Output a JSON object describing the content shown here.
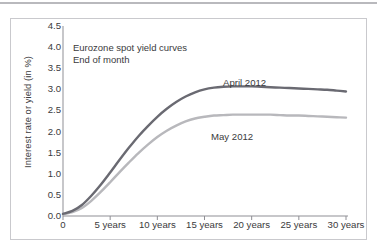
{
  "figure": {
    "title_lines": "Eurozone spot yield curves\nEnd of month",
    "y_axis_title": "Interest rate or yield (in %)"
  },
  "colors": {
    "april_series": "#6a6a72",
    "may_series": "#b8b8bc",
    "axis": "#8f8f95",
    "frame": "#c9c9cd",
    "text": "#3a3a3c"
  },
  "chart_data": {
    "type": "line",
    "title": "Eurozone spot yield curves",
    "subtitle": "End of month",
    "xlabel": "",
    "ylabel": "Interest rate or yield (in %)",
    "xlim": [
      0,
      30
    ],
    "ylim": [
      0.0,
      4.5
    ],
    "grid": false,
    "legend_position": "inline-annotation",
    "x_tick_labels": [
      "0",
      "5 years",
      "10 years",
      "15 years",
      "20 years",
      "25 years",
      "30 years"
    ],
    "x_ticks": [
      0,
      5,
      10,
      15,
      20,
      25,
      30
    ],
    "y_ticks": [
      0.0,
      0.5,
      1.0,
      1.5,
      2.0,
      2.5,
      3.0,
      3.5,
      4.0,
      4.5
    ],
    "y_tick_labels": [
      "0.0",
      "0.5",
      "1.0",
      "1.5",
      "2.0",
      "2.5",
      "3.0",
      "3.5",
      "4.0",
      "4.5"
    ],
    "x": [
      0,
      1,
      2,
      3,
      4,
      5,
      6,
      7,
      8,
      9,
      10,
      11,
      12,
      13,
      14,
      15,
      16,
      17,
      18,
      19,
      20,
      21,
      22,
      23,
      24,
      25,
      26,
      27,
      28,
      29,
      30
    ],
    "series": [
      {
        "name": "April 2012",
        "color": "#6a6a72",
        "values": [
          0.05,
          0.12,
          0.26,
          0.48,
          0.74,
          1.03,
          1.33,
          1.62,
          1.89,
          2.13,
          2.35,
          2.54,
          2.7,
          2.83,
          2.93,
          3.0,
          3.04,
          3.06,
          3.07,
          3.07,
          3.07,
          3.06,
          3.05,
          3.04,
          3.03,
          3.02,
          3.01,
          3.0,
          2.99,
          2.97,
          2.95
        ]
      },
      {
        "name": "May 2012",
        "color": "#b8b8bc",
        "values": [
          0.04,
          0.09,
          0.19,
          0.36,
          0.57,
          0.8,
          1.04,
          1.27,
          1.49,
          1.69,
          1.87,
          2.02,
          2.14,
          2.24,
          2.31,
          2.35,
          2.38,
          2.39,
          2.4,
          2.4,
          2.4,
          2.4,
          2.4,
          2.39,
          2.38,
          2.38,
          2.37,
          2.36,
          2.35,
          2.34,
          2.33
        ]
      }
    ],
    "annotations": [
      {
        "text": "April 2012",
        "x": 16.0,
        "y": 3.45
      },
      {
        "text": "May 2012",
        "x": 14.7,
        "y": 1.95
      }
    ]
  }
}
